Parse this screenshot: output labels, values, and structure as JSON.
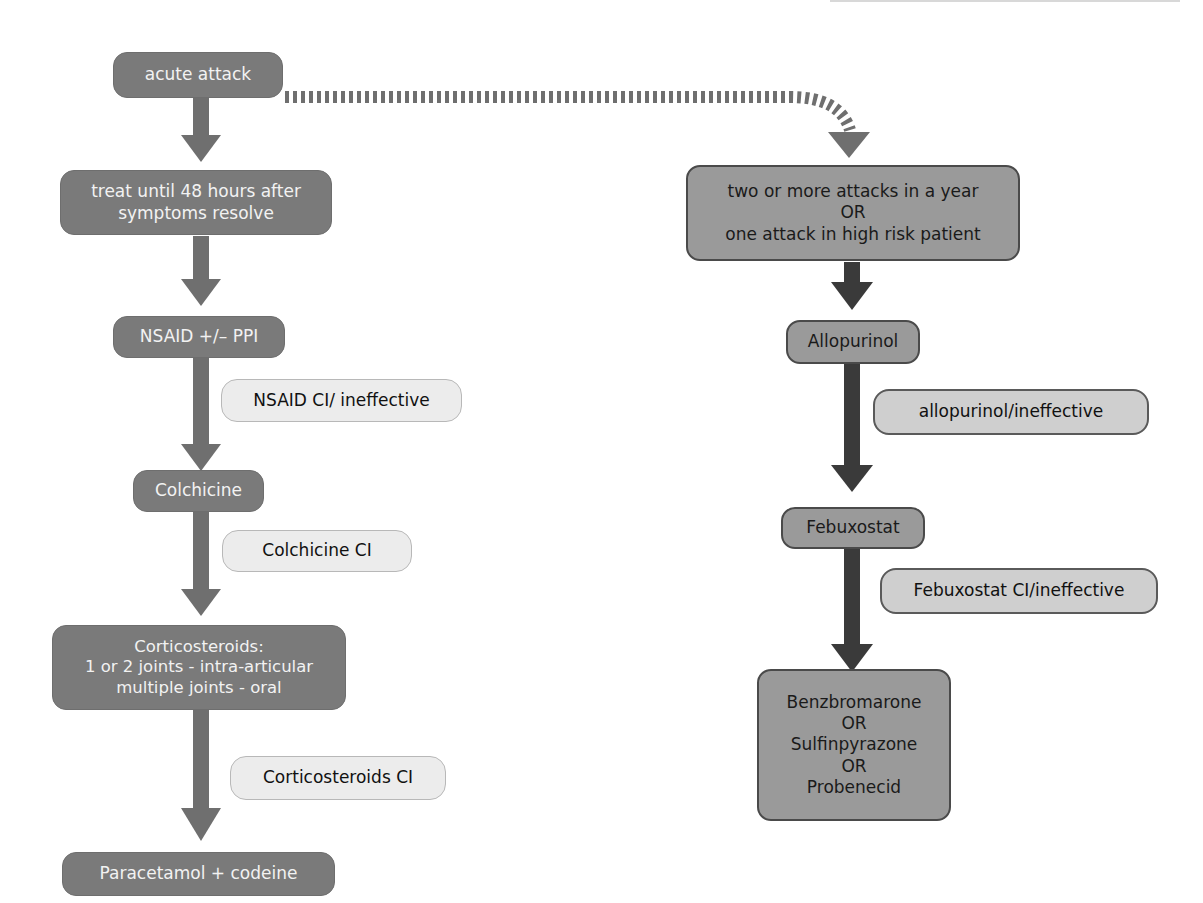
{
  "colors": {
    "left_arrow": "#6f6f6f",
    "right_arrow": "#3a3a3a",
    "dark_node": "#7a7a7a",
    "mid_node": "#9a9a9a",
    "light_label": "#ececec",
    "light_mid_label": "#cfcfcf"
  },
  "left_flow": {
    "acute_attack": "acute attack",
    "treat_until": "treat until 48 hours after\nsymptoms resolve",
    "nsaid": "NSAID +/– PPI",
    "nsaid_ci": "NSAID CI/ ineffective",
    "colchicine": "Colchicine",
    "colchicine_ci": "Colchicine CI",
    "corticosteroids": "Corticosteroids:\n1 or 2 joints - intra-articular\nmultiple joints - oral",
    "corticosteroids_ci": "Corticosteroids CI",
    "paracetamol": "Paracetamol + codeine"
  },
  "right_flow": {
    "criteria": "two or more attacks in a year\nOR\none attack in high risk patient",
    "allopurinol": "Allopurinol",
    "allopurinol_ci": "allopurinol/ineffective",
    "febuxostat": "Febuxostat",
    "febuxostat_ci": "Febuxostat CI/ineffective",
    "uricosurics": "Benzbromarone\nOR\nSulfinpyrazone\nOR\nProbenecid"
  }
}
